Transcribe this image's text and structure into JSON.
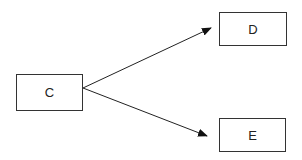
{
  "diagram": {
    "nodes": [
      {
        "id": "C",
        "label": "C"
      },
      {
        "id": "D",
        "label": "D"
      },
      {
        "id": "E",
        "label": "E"
      }
    ],
    "edges": [
      {
        "from": "C",
        "to": "D"
      },
      {
        "from": "C",
        "to": "E"
      }
    ]
  }
}
